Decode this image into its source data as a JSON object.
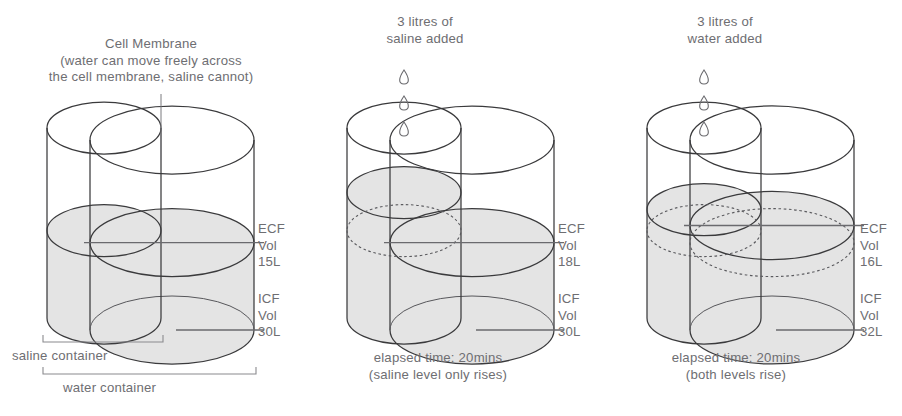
{
  "figure": {
    "title_note": "Cell Membrane",
    "membrane_note": "(water can move freely across\nthe cell membrane, saline cannot)"
  },
  "panels": [
    {
      "id": "baseline",
      "header": "",
      "membrane_label": "Cell Membrane",
      "membrane_sub": "(water can move freely across\nthe cell membrane, saline cannot)",
      "ecf": {
        "name": "ECF",
        "volume": "Vol 15L"
      },
      "icf": {
        "name": "ICF",
        "volume": "Vol 30L"
      },
      "caption": "",
      "brackets": [
        {
          "label": "saline container"
        },
        {
          "label": "water container"
        }
      ],
      "droplets": 0,
      "saline_level_pct": 0.46,
      "water_level_pct": 0.46,
      "dashed_saline": false,
      "dashed_water": false
    },
    {
      "id": "saline-added",
      "header": "3 litres of\nsaline added",
      "ecf": {
        "name": "ECF",
        "volume": "Vol 18L"
      },
      "icf": {
        "name": "ICF",
        "volume": "Vol 30L"
      },
      "caption": "elapsed time: 20mins\n(saline level only rises)",
      "droplets": 3,
      "saline_level_pct": 0.66,
      "water_level_pct": 0.46,
      "dashed_saline": true,
      "dashed_water": false
    },
    {
      "id": "water-added",
      "header": "3 litres of\nwater added",
      "ecf": {
        "name": "ECF",
        "volume": "Vol 16L"
      },
      "icf": {
        "name": "ICF",
        "volume": "Vol 32L"
      },
      "caption": "elapsed time: 20mins\n(both levels rise)",
      "droplets": 3,
      "saline_level_pct": 0.57,
      "water_level_pct": 0.55,
      "dashed_saline": true,
      "dashed_water": true
    }
  ],
  "colors": {
    "fluid": "#e4e4e4",
    "outline": "#3a3a3c",
    "text": "#6e6e72",
    "dashed": "#5a5a5e"
  }
}
